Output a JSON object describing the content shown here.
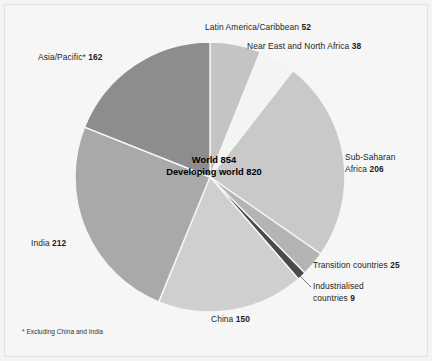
{
  "chart_data": {
    "type": "pie",
    "title": "",
    "total_label": "World 854",
    "subtotal_label": "Developing world 820",
    "total_value": 854,
    "unit": "millions of undernourished people",
    "categories": [
      "Latin America/Caribbean",
      "Near East and North Africa",
      "Sub-Saharan Africa",
      "Transition countries",
      "Industrialised countries",
      "China",
      "India",
      "Asia/Pacific*"
    ],
    "values": [
      52,
      38,
      206,
      25,
      9,
      150,
      212,
      162
    ],
    "colors": [
      "#c4c4c4",
      "#f4f4f2",
      "#c9c9c9",
      "#b4b4b4",
      "#4a4a4a",
      "#cfcfcf",
      "#a9a9a9",
      "#8d8d8d"
    ],
    "legend": "labels",
    "legend_position": "around-slices",
    "footnote": "* Excluding China and India"
  },
  "slices": [
    {
      "name": "latin-america",
      "label": "Latin America/Caribbean",
      "value": "52",
      "color": "#c4c4c4",
      "start": 0,
      "end": 21.92
    },
    {
      "name": "near-east",
      "label": "Near East and North Africa",
      "value": "38",
      "color": "#f4f4f2",
      "start": 21.92,
      "end": 37.94
    },
    {
      "name": "sub-saharan-africa",
      "label_line1": "Sub-Saharan",
      "label_line2": "Africa",
      "label": "Sub-Saharan Africa",
      "value": "206",
      "color": "#c9c9c9",
      "start": 37.94,
      "end": 124.78
    },
    {
      "name": "transition-countries",
      "label": "Transition countries",
      "value": "25",
      "color": "#b4b4b4",
      "start": 124.78,
      "end": 135.32
    },
    {
      "name": "industrialised-countries",
      "label_line1": "Industrialised",
      "label_line2": "countries",
      "label": "Industrialised countries",
      "value": "9",
      "color": "#4a4a4a",
      "start": 135.32,
      "end": 139.11
    },
    {
      "name": "china",
      "label": "China",
      "value": "150",
      "color": "#cfcfcf",
      "start": 139.11,
      "end": 202.34
    },
    {
      "name": "india",
      "label": "India",
      "value": "212",
      "color": "#a9a9a9",
      "start": 202.34,
      "end": 291.71
    },
    {
      "name": "asia-pacific",
      "label": "Asia/Pacific*",
      "value": "162",
      "color": "#8d8d8d",
      "start": 291.71,
      "end": 360
    }
  ],
  "center": {
    "line1": "World 854",
    "line2": "Developing world 820"
  },
  "footnote": "* Excluding China and India"
}
